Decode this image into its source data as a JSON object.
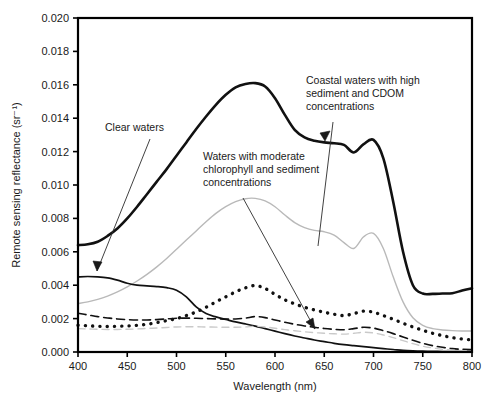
{
  "chart_data": {
    "type": "line",
    "title": "",
    "xlabel": "Wavelength (nm)",
    "ylabel": "Remote sensing reflectance (sr⁻¹)",
    "xlim": [
      400,
      800
    ],
    "ylim": [
      0.0,
      0.02
    ],
    "xticks": [
      "400",
      "450",
      "500",
      "550",
      "600",
      "650",
      "700",
      "750",
      "800"
    ],
    "yticks": [
      "0.020",
      "0.018",
      "0.016",
      "0.014",
      "0.012",
      "0.010",
      "0.008",
      "0.006",
      "0.004",
      "0.002",
      "0.000"
    ],
    "grid": false,
    "legend_position": "none",
    "x": [
      400,
      410,
      420,
      430,
      440,
      450,
      460,
      470,
      480,
      490,
      500,
      510,
      520,
      530,
      540,
      550,
      560,
      570,
      580,
      590,
      600,
      610,
      620,
      630,
      640,
      650,
      660,
      670,
      680,
      690,
      700,
      710,
      720,
      730,
      740,
      750,
      760,
      770,
      780,
      790,
      800
    ],
    "series": [
      {
        "name": "Coastal waters with high sediment and CDOM concentrations",
        "style": "thick-solid-black",
        "color": "#111111",
        "width": 2.6,
        "values": [
          0.0064,
          0.00645,
          0.0066,
          0.00695,
          0.0074,
          0.008,
          0.0087,
          0.00945,
          0.0102,
          0.01095,
          0.01175,
          0.01255,
          0.01335,
          0.0141,
          0.0148,
          0.0154,
          0.01585,
          0.01605,
          0.0161,
          0.0159,
          0.0152,
          0.0142,
          0.0133,
          0.01285,
          0.01265,
          0.01255,
          0.0125,
          0.0124,
          0.01195,
          0.01245,
          0.0127,
          0.0116,
          0.009,
          0.006,
          0.004,
          0.0035,
          0.00348,
          0.0035,
          0.00352,
          0.00368,
          0.00382
        ]
      },
      {
        "name": "Waters with moderate chlorophyll and sediment concentrations",
        "style": "thin-solid-gray",
        "color": "#b9b9b9",
        "width": 1.4,
        "values": [
          0.0029,
          0.003,
          0.00315,
          0.00335,
          0.0036,
          0.0039,
          0.00425,
          0.00465,
          0.0051,
          0.0056,
          0.00615,
          0.0067,
          0.00725,
          0.0078,
          0.0083,
          0.0087,
          0.009,
          0.00918,
          0.0092,
          0.00905,
          0.0087,
          0.0082,
          0.00775,
          0.00745,
          0.00728,
          0.0072,
          0.007,
          0.00655,
          0.0062,
          0.0069,
          0.0071,
          0.0062,
          0.0045,
          0.003,
          0.00205,
          0.0016,
          0.0014,
          0.00132,
          0.00128,
          0.00126,
          0.00126
        ]
      },
      {
        "name": "Clear waters",
        "style": "thin-solid-black",
        "color": "#111111",
        "width": 1.7,
        "values": [
          0.0045,
          0.00452,
          0.0045,
          0.00444,
          0.0043,
          0.00412,
          0.004,
          0.00396,
          0.00392,
          0.00385,
          0.0037,
          0.0033,
          0.0027,
          0.0023,
          0.0021,
          0.00195,
          0.0018,
          0.00168,
          0.00155,
          0.0014,
          0.00125,
          0.0011,
          0.00096,
          0.00084,
          0.00072,
          0.00062,
          0.00052,
          0.00044,
          0.00038,
          0.00032,
          0.00026,
          0.0002,
          0.00015,
          0.0001,
          7e-05,
          5e-05,
          4e-05,
          3e-05,
          2e-05,
          2e-05,
          2e-05
        ]
      },
      {
        "name": "Dotted reflectance spectrum",
        "style": "dotted-black",
        "color": "#111111",
        "width": 3.4,
        "values": [
          0.0016,
          0.00157,
          0.00154,
          0.00153,
          0.00154,
          0.00156,
          0.0016,
          0.00166,
          0.00176,
          0.00188,
          0.002,
          0.00218,
          0.0024,
          0.00268,
          0.003,
          0.0033,
          0.0036,
          0.00384,
          0.00398,
          0.0038,
          0.00345,
          0.00312,
          0.00288,
          0.00268,
          0.00252,
          0.00238,
          0.00226,
          0.00218,
          0.0023,
          0.00245,
          0.00238,
          0.00218,
          0.00196,
          0.00172,
          0.0015,
          0.0013,
          0.00112,
          0.00098,
          0.00086,
          0.00078,
          0.00072
        ]
      },
      {
        "name": "Dashed reflectance spectrum",
        "style": "dashed-black",
        "color": "#111111",
        "width": 1.6,
        "values": [
          0.00232,
          0.00222,
          0.00212,
          0.00204,
          0.00198,
          0.00194,
          0.00192,
          0.00192,
          0.00194,
          0.00198,
          0.00202,
          0.00203,
          0.00202,
          0.002,
          0.00198,
          0.00197,
          0.00198,
          0.00203,
          0.00212,
          0.00206,
          0.00192,
          0.00178,
          0.00166,
          0.00156,
          0.00148,
          0.00141,
          0.00136,
          0.00133,
          0.0014,
          0.00148,
          0.00143,
          0.00128,
          0.0011,
          0.0009,
          0.0007,
          0.00052,
          0.00038,
          0.00028,
          0.0002,
          0.00016,
          0.00014
        ]
      },
      {
        "name": "Light dashed reflectance spectrum",
        "style": "dashed-gray",
        "color": "#c9c9c9",
        "width": 1.4,
        "values": [
          0.0014,
          0.00138,
          0.00136,
          0.00135,
          0.00135,
          0.00136,
          0.00138,
          0.00141,
          0.00144,
          0.00147,
          0.0015,
          0.00151,
          0.00151,
          0.0015,
          0.00149,
          0.00148,
          0.00148,
          0.0015,
          0.00154,
          0.0015,
          0.00142,
          0.00134,
          0.00127,
          0.00121,
          0.00116,
          0.00112,
          0.00109,
          0.00107,
          0.00112,
          0.00118,
          0.00114,
          0.00102,
          0.00086,
          0.00068,
          0.0005,
          0.00035,
          0.00024,
          0.00016,
          0.00011,
          8e-05,
          7e-05
        ]
      }
    ],
    "annotations": [
      {
        "id": "clear-waters",
        "lines": [
          "Clear waters"
        ],
        "text_x": 105,
        "text_y": 131,
        "leader": "M 150 139 L 97 271",
        "arrow": "M 97 271 L 93 261 L 102 262 Z"
      },
      {
        "id": "moderate-chl-sediment",
        "lines": [
          "Waters with moderate",
          "chlorophyll and sediment",
          "concentrations"
        ],
        "text_x": 203,
        "text_y": 160,
        "leader": "M 243 198 L 315 329",
        "arrow": "M 315 329 L 306 322 L 313 318 Z"
      },
      {
        "id": "coastal-high-sediment-cdom",
        "lines": [
          "Coastal waters with high",
          "sediment and CDOM",
          "concentrations"
        ],
        "text_x": 306,
        "text_y": 84,
        "leader": "M 333 122 L 318 246",
        "arrow": "M 330 131 L 320 133 L 325 141 Z"
      }
    ]
  },
  "figure": {
    "plot_left": 78,
    "plot_right": 472,
    "plot_top": 18,
    "plot_bottom": 352
  }
}
